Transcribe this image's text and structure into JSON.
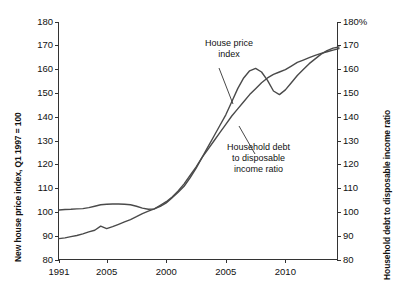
{
  "chart_data": {
    "type": "line",
    "title": "",
    "xlabel": "",
    "ylabel": "New house price index, Q1 1997 = 100",
    "y2label": "Household debt to disposable income ratio",
    "xlim": [
      1991,
      2014.5
    ],
    "ylim": [
      80,
      180
    ],
    "y2lim": [
      80,
      180
    ],
    "grid": false,
    "legend": "annotations",
    "x_tick_labels": [
      "1991",
      "2005",
      "2000",
      "2005",
      "2010"
    ],
    "x_tick_values": [
      1991,
      1995,
      2000,
      2005,
      2010
    ],
    "y_tick_labels": [
      "80",
      "90",
      "100",
      "110",
      "120",
      "130",
      "140",
      "150",
      "160",
      "170",
      "180"
    ],
    "y2_tick_labels": [
      "80",
      "90",
      "100",
      "110",
      "120",
      "130",
      "140",
      "150",
      "160",
      "170",
      "180%"
    ],
    "y_tick_values": [
      80,
      90,
      100,
      110,
      120,
      130,
      140,
      150,
      160,
      170,
      180
    ],
    "annotations": [
      {
        "id": "house-price-index",
        "line1": "House price",
        "line2": "index"
      },
      {
        "id": "household-debt",
        "line1": "Household debt",
        "line2": "to disposable",
        "line3": "income ratio"
      }
    ],
    "series": [
      {
        "name": "House price index",
        "color": "#4a4a4a",
        "x": [
          1991.0,
          1991.5,
          1992.0,
          1992.5,
          1993.0,
          1993.5,
          1994.0,
          1994.5,
          1995.0,
          1995.5,
          1996.0,
          1996.5,
          1997.0,
          1997.5,
          1998.0,
          1998.5,
          1999.0,
          1999.5,
          2000.0,
          2000.5,
          2001.0,
          2001.5,
          2002.0,
          2002.5,
          2003.0,
          2003.5,
          2004.0,
          2004.5,
          2005.0,
          2005.5,
          2006.0,
          2006.5,
          2007.0,
          2007.5,
          2008.0,
          2008.5,
          2009.0,
          2009.5,
          2010.0,
          2010.5,
          2011.0,
          2011.5,
          2012.0,
          2012.5,
          2013.0,
          2013.5,
          2014.0,
          2014.5
        ],
        "y": [
          101.0,
          101.2,
          101.3,
          101.5,
          101.6,
          102.0,
          102.6,
          103.2,
          103.4,
          103.5,
          103.5,
          103.4,
          103.2,
          102.6,
          101.8,
          101.3,
          101.5,
          102.5,
          104.0,
          106.2,
          108.5,
          111.0,
          114.5,
          118.5,
          123.0,
          127.5,
          132.0,
          136.5,
          141.0,
          146.5,
          152.0,
          156.5,
          159.5,
          160.5,
          159.0,
          155.5,
          151.0,
          149.5,
          151.5,
          154.5,
          157.5,
          160.0,
          162.5,
          164.5,
          166.5,
          168.0,
          169.0,
          169.5
        ]
      },
      {
        "name": "Household debt to disposable income ratio",
        "color": "#4a4a4a",
        "x": [
          1991.0,
          1991.5,
          1992.0,
          1992.5,
          1993.0,
          1993.5,
          1994.0,
          1994.5,
          1995.0,
          1995.5,
          1996.0,
          1996.5,
          1997.0,
          1997.5,
          1998.0,
          1998.5,
          1999.0,
          1999.5,
          2000.0,
          2000.5,
          2001.0,
          2001.5,
          2002.0,
          2002.5,
          2003.0,
          2003.5,
          2004.0,
          2004.5,
          2005.0,
          2005.5,
          2006.0,
          2006.5,
          2007.0,
          2007.5,
          2008.0,
          2008.5,
          2009.0,
          2009.5,
          2010.0,
          2010.5,
          2011.0,
          2011.5,
          2012.0,
          2012.5,
          2013.0,
          2013.5,
          2014.0,
          2014.5
        ],
        "y": [
          89.0,
          89.3,
          89.8,
          90.3,
          91.0,
          91.8,
          92.5,
          94.2,
          93.2,
          94.0,
          95.0,
          96.0,
          97.0,
          98.2,
          99.5,
          100.5,
          101.5,
          103.0,
          104.5,
          106.5,
          109.0,
          112.0,
          115.5,
          119.0,
          123.0,
          126.5,
          130.0,
          133.5,
          137.0,
          140.5,
          143.5,
          146.5,
          149.5,
          152.0,
          154.5,
          156.5,
          158.0,
          159.0,
          160.0,
          161.5,
          163.0,
          164.0,
          165.0,
          166.0,
          166.8,
          167.5,
          168.2,
          168.8
        ]
      }
    ]
  }
}
